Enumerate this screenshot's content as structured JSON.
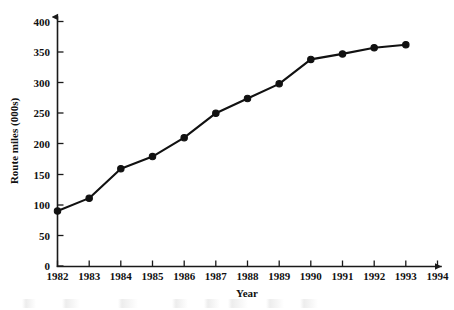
{
  "chart_data": {
    "type": "line",
    "title": "",
    "xlabel": "Year",
    "ylabel": "Route miles (000s)",
    "x": [
      1982,
      1983,
      1984,
      1985,
      1986,
      1987,
      1988,
      1989,
      1990,
      1991,
      1992,
      1993
    ],
    "values": [
      90,
      111,
      159,
      179,
      210,
      250,
      274,
      298,
      338,
      347,
      357,
      362
    ],
    "series": [
      {
        "name": "Route miles (000s)",
        "values": [
          90,
          111,
          159,
          179,
          210,
          250,
          274,
          298,
          338,
          347,
          357,
          362
        ]
      }
    ],
    "categories": [
      "1982",
      "1983",
      "1984",
      "1985",
      "1986",
      "1987",
      "1988",
      "1989",
      "1990",
      "1991",
      "1992",
      "1993"
    ],
    "xticklabels": [
      "1982",
      "1983",
      "1984",
      "1985",
      "1986",
      "1987",
      "1988",
      "1989",
      "1990",
      "1991",
      "1992",
      "1993",
      "1994"
    ],
    "xticks": [
      1982,
      1983,
      1984,
      1985,
      1986,
      1987,
      1988,
      1989,
      1990,
      1991,
      1992,
      1993,
      1994
    ],
    "yticklabels": [
      "0",
      "50",
      "100",
      "150",
      "200",
      "250",
      "300",
      "350",
      "400"
    ],
    "yticks": [
      0,
      50,
      100,
      150,
      200,
      250,
      300,
      350,
      400
    ],
    "xlim": [
      1982,
      1994
    ],
    "ylim": [
      0,
      400
    ],
    "grid": false,
    "legend": false,
    "legend_position": "none",
    "marker": "filled-circle",
    "line_color": "#111111",
    "marker_color": "#111111",
    "axis_color": "#1a1a1a",
    "background_color": "#ffffff"
  }
}
